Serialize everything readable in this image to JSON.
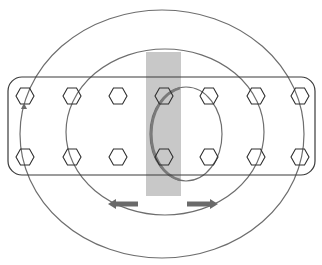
{
  "diagram": {
    "title": "",
    "colors": {
      "background": "#ffffff",
      "outline": "#3a3a3a",
      "circle": "#6e6e6e",
      "highlight_band": "#c8c8c8",
      "arrow": "#6a6a6a",
      "inner_arc": "#7a7a7a"
    },
    "board": {
      "x": 8,
      "y": 77,
      "width": 307,
      "height": 98,
      "radius": 14
    },
    "band": {
      "x": 146,
      "y": 52,
      "width": 35,
      "height": 144
    },
    "hexagon_rows": [
      {
        "y": 96,
        "xs": [
          25,
          72,
          118,
          164,
          209,
          256,
          300
        ]
      },
      {
        "y": 157,
        "xs": [
          25,
          72,
          118,
          164,
          209,
          256,
          300
        ]
      }
    ],
    "circles": [
      {
        "name": "outer",
        "cx": 162,
        "cy": 134,
        "rx": 142,
        "ry": 124
      },
      {
        "name": "middle",
        "cx": 165,
        "cy": 132,
        "rx": 99,
        "ry": 83
      },
      {
        "name": "inner",
        "cx": 186,
        "cy": 134,
        "rx": 36,
        "ry": 47
      }
    ],
    "arrows": [
      {
        "name": "left-arrow",
        "from": [
          138,
          204
        ],
        "to": [
          108,
          204
        ],
        "direction": "left"
      },
      {
        "name": "right-arrow",
        "from": [
          187,
          204
        ],
        "to": [
          218,
          204
        ],
        "direction": "right"
      }
    ],
    "small_arrow": {
      "x": 24,
      "y": 107,
      "direction": "up"
    }
  }
}
